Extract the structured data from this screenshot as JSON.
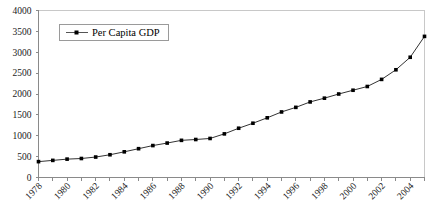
{
  "chart_data": {
    "type": "line",
    "title": "",
    "subtitle": "",
    "xlabel": "",
    "ylabel": "",
    "xlim": [
      1978,
      2005
    ],
    "ylim": [
      0,
      4000
    ],
    "ytick_labels": [
      "0",
      "500",
      "1000",
      "1500",
      "2000",
      "2500",
      "3000",
      "3500",
      "4000"
    ],
    "ytick_values": [
      0,
      500,
      1000,
      1500,
      2000,
      2500,
      3000,
      3500,
      4000
    ],
    "xtick_labels": [
      "1978",
      "1980",
      "1982",
      "1984",
      "1986",
      "1988",
      "1990",
      "1992",
      "1994",
      "1996",
      "1998",
      "2000",
      "2002",
      "2004"
    ],
    "xtick_values": [
      1978,
      1980,
      1982,
      1984,
      1986,
      1988,
      1990,
      1992,
      1994,
      1996,
      1998,
      2000,
      2002,
      2004
    ],
    "xtick_rotation_degrees": 45,
    "grid": false,
    "legend_position": "top-left-inside",
    "marker": "square",
    "line_color": "#333333",
    "marker_color": "#000000",
    "series": [
      {
        "name": "Per Capita GDP",
        "x": [
          1978,
          1979,
          1980,
          1981,
          1982,
          1983,
          1984,
          1985,
          1986,
          1987,
          1988,
          1989,
          1990,
          1991,
          1992,
          1993,
          1994,
          1995,
          1996,
          1997,
          1998,
          1999,
          2000,
          2001,
          2002,
          2003,
          2004,
          2005
        ],
        "values": [
          381,
          419,
          463,
          492,
          528,
          583,
          695,
          858,
          963,
          1112,
          1366,
          1519,
          1644,
          1893,
          2311,
          2998,
          4044,
          5046,
          5846,
          6420,
          6796,
          7159,
          7858,
          8622,
          9398,
          10542,
          12336,
          14040
        ]
      }
    ],
    "series_plot_values": [
      {
        "name": "Per Capita GDP",
        "x": [
          1978,
          1979,
          1980,
          1981,
          1982,
          1983,
          1984,
          1985,
          1986,
          1987,
          1988,
          1989,
          1990,
          1991,
          1992,
          1993,
          1994,
          1995,
          1996,
          1997,
          1998,
          1999,
          2000,
          2001,
          2002,
          2003,
          2004,
          2005
        ],
        "values": [
          380,
          410,
          440,
          455,
          490,
          545,
          615,
          690,
          765,
          825,
          890,
          910,
          935,
          1045,
          1180,
          1300,
          1430,
          1570,
          1680,
          1810,
          1900,
          2000,
          2090,
          2180,
          2350,
          2580,
          2880,
          3380
        ]
      }
    ],
    "legend": [
      {
        "label": "Per Capita GDP",
        "color": "#333333"
      }
    ]
  },
  "legend_entry_label": "Per Capita GDP"
}
